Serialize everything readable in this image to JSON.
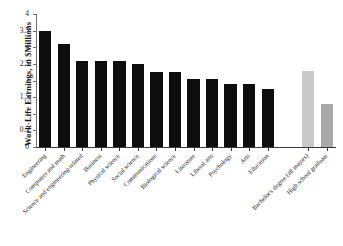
{
  "chart_data": {
    "type": "bar",
    "title": "",
    "xlabel": "",
    "ylabel": "Work-Life Earnings, in $Millions",
    "ylim": [
      0,
      4
    ],
    "yticks": [
      0,
      0.5,
      1,
      1.5,
      2,
      2.5,
      3,
      3.5,
      4
    ],
    "ytick_labels": [
      "0",
      "0.5",
      "1",
      "1.5",
      "2",
      "2.5",
      "3",
      "3.5",
      "4"
    ],
    "grid": false,
    "legend": "none",
    "categories": [
      "Engineering",
      "Computers and math",
      "Science and engineering-related",
      "Business",
      "Physical science",
      "Social science",
      "Communications",
      "Biological science",
      "Literature",
      "Liberal arts",
      "Psychology",
      "Arts",
      "Education",
      "Bachelor's degree (all majors)",
      "High school graduate"
    ],
    "values": [
      3.5,
      3.1,
      2.6,
      2.6,
      2.6,
      2.5,
      2.25,
      2.25,
      2.05,
      2.05,
      1.9,
      1.9,
      1.75,
      2.3,
      1.3
    ],
    "bar_colors": [
      "#0d0d0d",
      "#0d0d0d",
      "#0d0d0d",
      "#0d0d0d",
      "#0d0d0d",
      "#0d0d0d",
      "#0d0d0d",
      "#0d0d0d",
      "#0d0d0d",
      "#0d0d0d",
      "#0d0d0d",
      "#0d0d0d",
      "#0d0d0d",
      "#c9c9c9",
      "#a8a8a8"
    ],
    "series": [
      {
        "name": "Work-life earnings by field of degree",
        "values": [
          3.5,
          3.1,
          2.6,
          2.6,
          2.6,
          2.5,
          2.25,
          2.25,
          2.05,
          2.05,
          1.9,
          1.9,
          1.75,
          2.3,
          1.3
        ]
      }
    ]
  },
  "footer": {
    "source_note": ""
  }
}
